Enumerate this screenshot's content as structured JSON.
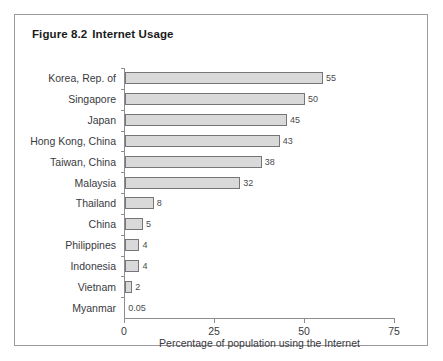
{
  "figure": {
    "number": "Figure 8.2",
    "title": "Internet Usage"
  },
  "chart_data": {
    "type": "bar",
    "orientation": "horizontal",
    "xlabel": "Percentage of population using the Internet",
    "ylabel": "",
    "xlim": [
      0,
      75
    ],
    "xticks": [
      "0",
      "25",
      "50",
      "75"
    ],
    "grid": false,
    "legend": null,
    "bar_fill": "#d9d9d9",
    "bar_border": "#75757a",
    "categories": [
      "Korea, Rep. of",
      "Singapore",
      "Japan",
      "Hong Kong, China",
      "Taiwan, China",
      "Malaysia",
      "Thailand",
      "China",
      "Philippines",
      "Indonesia",
      "Vietnam",
      "Myanmar"
    ],
    "values": [
      55,
      50,
      45,
      43,
      38,
      32,
      8,
      5,
      4,
      4,
      2,
      0.05
    ],
    "value_labels": [
      "55",
      "50",
      "45",
      "43",
      "38",
      "32",
      "8",
      "5",
      "4",
      "4",
      "2",
      "0.05"
    ]
  }
}
